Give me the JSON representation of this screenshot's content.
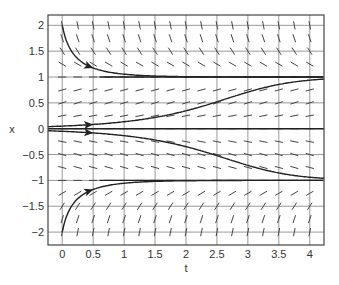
{
  "chart_data": {
    "type": "line",
    "title": "",
    "subtitle": "Direction field with solution curves",
    "xlabel": "t",
    "ylabel": "x",
    "xlim": [
      -0.23,
      4.23
    ],
    "ylim": [
      -2.25,
      2.2
    ],
    "grid": true,
    "legend": null,
    "xticks": [
      0,
      0.5,
      1,
      1.5,
      2,
      2.5,
      3,
      3.5,
      4
    ],
    "xtick_labels": [
      "0",
      "0.5",
      "1",
      "1.5",
      "2",
      "2.5",
      "3",
      "3.5",
      "4"
    ],
    "yticks": [
      2,
      1.5,
      1,
      0.5,
      0,
      -0.5,
      -1,
      -1.5,
      -2
    ],
    "ytick_labels": [
      "2",
      "1.5",
      "1",
      "0.5",
      "0",
      "−0.5",
      "−1",
      "−1.5",
      "−2"
    ],
    "direction_field": {
      "equation": "dx/dt = x - x^3",
      "t_step": 0.25,
      "x_step": 0.25
    },
    "series": [
      {
        "name": "solution x(0)=2",
        "x0": 2.0,
        "t_start": -0.23,
        "t_end": 4.23,
        "arrow_at_t": 0.5,
        "color": "#222222"
      },
      {
        "name": "solution x(0)=0.05",
        "x0": 0.05,
        "t_start": -0.23,
        "t_end": 4.23,
        "arrow_at_t": 0.5,
        "color": "#222222"
      },
      {
        "name": "solution x(0)=0",
        "x0": 0.0,
        "t_start": -0.23,
        "t_end": 4.23,
        "arrow_at_t": null,
        "color": "#222222"
      },
      {
        "name": "solution x(0)=-0.05",
        "x0": -0.05,
        "t_start": -0.23,
        "t_end": 4.23,
        "arrow_at_t": 0.5,
        "color": "#222222"
      },
      {
        "name": "solution x(0)=-2",
        "x0": -2.0,
        "t_start": -0.23,
        "t_end": 4.23,
        "arrow_at_t": 0.5,
        "color": "#222222"
      },
      {
        "name": "equilibrium x=1",
        "x0": 1.0,
        "t_start": 0.6,
        "t_end": 4.23,
        "arrow_at_t": null,
        "color": "#222222"
      },
      {
        "name": "equilibrium x=-1",
        "x0": -1.0,
        "t_start": 0.6,
        "t_end": 4.23,
        "arrow_at_t": null,
        "color": "#222222"
      }
    ]
  },
  "colors": {
    "frame": "#444444",
    "grid": "#999999",
    "field": "#444444",
    "curve": "#222222"
  }
}
